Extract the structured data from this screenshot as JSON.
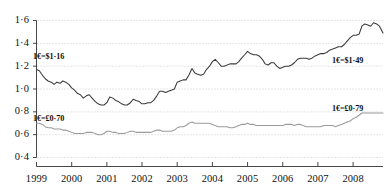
{
  "chart_data": {
    "type": "line",
    "title": "",
    "subtitle": "",
    "xlabel": "",
    "ylabel": "",
    "xlim": [
      1999.0,
      2008.85
    ],
    "ylim": [
      0.4,
      1.65
    ],
    "grid": "horizontal-dotted",
    "legend_position": "none",
    "yticks": [
      "1·6",
      "1·4",
      "1·2",
      "1·0",
      "0·8",
      "0·6",
      "0·4"
    ],
    "ytick_values": [
      1.6,
      1.4,
      1.2,
      1.0,
      0.8,
      0.6,
      0.4
    ],
    "xticks": [
      "1999",
      "2000",
      "2001",
      "2002",
      "2003",
      "2004",
      "2005",
      "2006",
      "2007",
      "2008"
    ],
    "xtick_values": [
      1999,
      2000,
      2001,
      2002,
      2003,
      2004,
      2005,
      2006,
      2007,
      2008
    ],
    "series": [
      {
        "name": "euro-us-dollar",
        "color": "#3a3a3a",
        "x": [
          1999.0,
          1999.08,
          1999.17,
          1999.25,
          1999.33,
          1999.42,
          1999.5,
          1999.58,
          1999.67,
          1999.75,
          1999.83,
          1999.92,
          2000.0,
          2000.08,
          2000.17,
          2000.25,
          2000.33,
          2000.42,
          2000.5,
          2000.58,
          2000.67,
          2000.75,
          2000.83,
          2000.92,
          2001.0,
          2001.08,
          2001.17,
          2001.25,
          2001.33,
          2001.42,
          2001.5,
          2001.58,
          2001.67,
          2001.75,
          2001.83,
          2001.92,
          2002.0,
          2002.08,
          2002.17,
          2002.25,
          2002.33,
          2002.42,
          2002.5,
          2002.58,
          2002.67,
          2002.75,
          2002.83,
          2002.92,
          2003.0,
          2003.08,
          2003.17,
          2003.25,
          2003.33,
          2003.42,
          2003.5,
          2003.58,
          2003.67,
          2003.75,
          2003.83,
          2003.92,
          2004.0,
          2004.08,
          2004.17,
          2004.25,
          2004.33,
          2004.42,
          2004.5,
          2004.58,
          2004.67,
          2004.75,
          2004.83,
          2004.92,
          2005.0,
          2005.08,
          2005.17,
          2005.25,
          2005.33,
          2005.42,
          2005.5,
          2005.58,
          2005.67,
          2005.75,
          2005.83,
          2005.92,
          2006.0,
          2006.08,
          2006.17,
          2006.25,
          2006.33,
          2006.42,
          2006.5,
          2006.58,
          2006.67,
          2006.75,
          2006.83,
          2006.92,
          2007.0,
          2007.08,
          2007.17,
          2007.25,
          2007.33,
          2007.42,
          2007.5,
          2007.58,
          2007.67,
          2007.75,
          2007.83,
          2007.92,
          2008.0,
          2008.08,
          2008.17,
          2008.25,
          2008.33,
          2008.42,
          2008.5,
          2008.58,
          2008.67,
          2008.75,
          2008.85
        ],
        "values": [
          1.17,
          1.16,
          1.12,
          1.09,
          1.07,
          1.06,
          1.04,
          1.06,
          1.05,
          1.07,
          1.06,
          1.04,
          1.01,
          0.99,
          0.96,
          0.95,
          0.92,
          0.94,
          0.95,
          0.92,
          0.89,
          0.87,
          0.86,
          0.86,
          0.88,
          0.93,
          0.92,
          0.9,
          0.89,
          0.87,
          0.86,
          0.86,
          0.88,
          0.91,
          0.9,
          0.89,
          0.87,
          0.87,
          0.88,
          0.88,
          0.9,
          0.94,
          0.98,
          0.98,
          0.97,
          0.98,
          0.99,
          1.0,
          1.06,
          1.07,
          1.08,
          1.08,
          1.12,
          1.18,
          1.14,
          1.13,
          1.12,
          1.13,
          1.17,
          1.2,
          1.24,
          1.26,
          1.23,
          1.2,
          1.2,
          1.21,
          1.22,
          1.22,
          1.22,
          1.24,
          1.27,
          1.3,
          1.33,
          1.31,
          1.3,
          1.3,
          1.29,
          1.26,
          1.22,
          1.21,
          1.23,
          1.23,
          1.2,
          1.18,
          1.19,
          1.2,
          1.2,
          1.21,
          1.23,
          1.26,
          1.27,
          1.27,
          1.27,
          1.26,
          1.27,
          1.29,
          1.3,
          1.31,
          1.31,
          1.32,
          1.34,
          1.35,
          1.36,
          1.37,
          1.37,
          1.39,
          1.42,
          1.45,
          1.47,
          1.47,
          1.48,
          1.55,
          1.57,
          1.56,
          1.55,
          1.58,
          1.57,
          1.55,
          1.49
        ]
      },
      {
        "name": "euro-pound-sterling",
        "color": "#9a9a9a",
        "x": [
          1999.0,
          1999.08,
          1999.17,
          1999.25,
          1999.33,
          1999.42,
          1999.5,
          1999.58,
          1999.67,
          1999.75,
          1999.83,
          1999.92,
          2000.0,
          2000.08,
          2000.17,
          2000.25,
          2000.33,
          2000.42,
          2000.5,
          2000.58,
          2000.67,
          2000.75,
          2000.83,
          2000.92,
          2001.0,
          2001.08,
          2001.17,
          2001.25,
          2001.33,
          2001.42,
          2001.5,
          2001.58,
          2001.67,
          2001.75,
          2001.83,
          2001.92,
          2002.0,
          2002.08,
          2002.17,
          2002.25,
          2002.33,
          2002.42,
          2002.5,
          2002.58,
          2002.67,
          2002.75,
          2002.83,
          2002.92,
          2003.0,
          2003.08,
          2003.17,
          2003.25,
          2003.33,
          2003.42,
          2003.5,
          2003.58,
          2003.67,
          2003.75,
          2003.83,
          2003.92,
          2004.0,
          2004.08,
          2004.17,
          2004.25,
          2004.33,
          2004.42,
          2004.5,
          2004.58,
          2004.67,
          2004.75,
          2004.83,
          2004.92,
          2005.0,
          2005.08,
          2005.17,
          2005.25,
          2005.33,
          2005.42,
          2005.5,
          2005.58,
          2005.67,
          2005.75,
          2005.83,
          2005.92,
          2006.0,
          2006.08,
          2006.17,
          2006.25,
          2006.33,
          2006.42,
          2006.5,
          2006.58,
          2006.67,
          2006.75,
          2006.83,
          2006.92,
          2007.0,
          2007.08,
          2007.17,
          2007.25,
          2007.33,
          2007.42,
          2007.5,
          2007.58,
          2007.67,
          2007.75,
          2007.83,
          2007.92,
          2008.0,
          2008.08,
          2008.17,
          2008.25,
          2008.33,
          2008.42,
          2008.5,
          2008.58,
          2008.67,
          2008.75,
          2008.85
        ],
        "values": [
          0.7,
          0.7,
          0.69,
          0.67,
          0.66,
          0.66,
          0.65,
          0.65,
          0.65,
          0.64,
          0.64,
          0.63,
          0.62,
          0.61,
          0.61,
          0.61,
          0.61,
          0.62,
          0.62,
          0.62,
          0.61,
          0.6,
          0.6,
          0.61,
          0.63,
          0.63,
          0.62,
          0.62,
          0.61,
          0.61,
          0.61,
          0.62,
          0.63,
          0.63,
          0.62,
          0.62,
          0.62,
          0.62,
          0.62,
          0.62,
          0.63,
          0.64,
          0.64,
          0.63,
          0.63,
          0.63,
          0.63,
          0.64,
          0.66,
          0.67,
          0.67,
          0.68,
          0.7,
          0.71,
          0.7,
          0.7,
          0.7,
          0.7,
          0.7,
          0.7,
          0.69,
          0.68,
          0.67,
          0.67,
          0.67,
          0.67,
          0.66,
          0.66,
          0.67,
          0.68,
          0.69,
          0.69,
          0.7,
          0.69,
          0.69,
          0.68,
          0.68,
          0.68,
          0.68,
          0.68,
          0.68,
          0.68,
          0.68,
          0.68,
          0.68,
          0.69,
          0.69,
          0.69,
          0.68,
          0.69,
          0.69,
          0.68,
          0.67,
          0.67,
          0.67,
          0.67,
          0.67,
          0.67,
          0.68,
          0.68,
          0.68,
          0.68,
          0.67,
          0.68,
          0.69,
          0.7,
          0.71,
          0.72,
          0.74,
          0.75,
          0.77,
          0.79,
          0.79,
          0.79,
          0.79,
          0.79,
          0.79,
          0.79,
          0.79
        ]
      }
    ],
    "annotations": [
      {
        "id": "dollar-start",
        "text": "1€=$1·16",
        "x_px": 33,
        "y_px": 52
      },
      {
        "id": "sterling-start",
        "text": "1€=£0·70",
        "x_px": 33,
        "y_px": 114
      },
      {
        "id": "dollar-end",
        "text": "1€=$1·49",
        "x_px": 332,
        "y_px": 56
      },
      {
        "id": "sterling-end",
        "text": "1€=£0·79",
        "x_px": 332,
        "y_px": 104
      }
    ]
  }
}
